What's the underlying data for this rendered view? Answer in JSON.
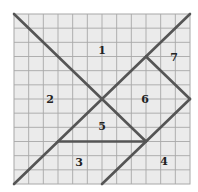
{
  "diagram": {
    "type": "tangram-grid-puzzle",
    "grid": {
      "cols": 12,
      "rows": 12
    },
    "colors": {
      "grid_bg": "#ebebeb",
      "grid_line": "#a8a8a8",
      "stroke": "#555555"
    },
    "pieces": [
      {
        "id": "1",
        "label": "1"
      },
      {
        "id": "2",
        "label": "2"
      },
      {
        "id": "3",
        "label": "3"
      },
      {
        "id": "4",
        "label": "4"
      },
      {
        "id": "5",
        "label": "5"
      },
      {
        "id": "6",
        "label": "6"
      },
      {
        "id": "7",
        "label": "7"
      }
    ]
  }
}
